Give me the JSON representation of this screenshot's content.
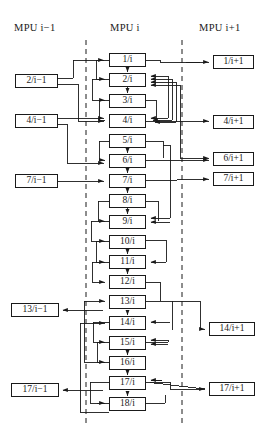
{
  "diagram": {
    "headers": [
      {
        "id": "hdr-mpu-prev",
        "text": "MPU  i−1",
        "x": 14,
        "y": 22
      },
      {
        "id": "hdr-mpu-cur",
        "text": "MPU  i",
        "x": 109,
        "y": 22
      },
      {
        "id": "hdr-mpu-next",
        "text": "MPU  i+1",
        "x": 200,
        "y": 22
      }
    ],
    "dividers": [
      {
        "id": "divider-left",
        "x": 86,
        "y1": 40,
        "y2": 426
      },
      {
        "id": "divider-right",
        "x": 182,
        "y1": 40,
        "y2": 426
      }
    ],
    "columns": {
      "left": {
        "label": "MPU i-1",
        "box_x": 15,
        "box_w": 43
      },
      "mid": {
        "label": "MPU i",
        "box_x": 109,
        "box_w": 37
      },
      "right": {
        "label": "MPU i+1",
        "box_x": 212,
        "box_w": 44
      }
    },
    "mid_boxes": [
      {
        "label": "1/i",
        "y": 53
      },
      {
        "label": "2/i",
        "y": 73
      },
      {
        "label": "3/i",
        "y": 94
      },
      {
        "label": "4/i",
        "y": 114
      },
      {
        "label": "5/i",
        "y": 134
      },
      {
        "label": "6/i",
        "y": 154
      },
      {
        "label": "7/i",
        "y": 174
      },
      {
        "label": "8/i",
        "y": 194
      },
      {
        "label": "9/i",
        "y": 215
      },
      {
        "label": "10/i",
        "y": 235
      },
      {
        "label": "11/i",
        "y": 255
      },
      {
        "label": "12/i",
        "y": 275
      },
      {
        "label": "13/i",
        "y": 295
      },
      {
        "label": "14/i",
        "y": 316
      },
      {
        "label": "15/i",
        "y": 336
      },
      {
        "label": "16/i",
        "y": 356
      },
      {
        "label": "17/i",
        "y": 376
      },
      {
        "label": "18/i",
        "y": 397
      }
    ],
    "left_boxes": [
      {
        "label": "2/i−1",
        "y": 74,
        "x": 15,
        "w": 43
      },
      {
        "label": "4/i−1",
        "y": 114,
        "x": 15,
        "w": 43
      },
      {
        "label": "7/i−1",
        "y": 174,
        "x": 15,
        "w": 43
      },
      {
        "label": "13/i−1",
        "y": 303,
        "x": 11,
        "w": 48
      },
      {
        "label": "17/i−1",
        "y": 383,
        "x": 11,
        "w": 48
      }
    ],
    "right_boxes": [
      {
        "label": "1/i+1",
        "y": 55,
        "x": 213,
        "w": 41
      },
      {
        "label": "4/i+1",
        "y": 115,
        "x": 213,
        "w": 41
      },
      {
        "label": "6/i+1",
        "y": 152,
        "x": 213,
        "w": 41
      },
      {
        "label": "7/i+1",
        "y": 172,
        "x": 213,
        "w": 41
      },
      {
        "label": "14/i+1",
        "y": 322,
        "x": 209,
        "w": 46
      },
      {
        "label": "17/i+1",
        "y": 382,
        "x": 209,
        "w": 46
      }
    ],
    "style": {
      "line_color": "#1a1a1a",
      "box_fill": "#ffffff",
      "background": "#ffffff",
      "divider_dash": "5,4"
    }
  }
}
